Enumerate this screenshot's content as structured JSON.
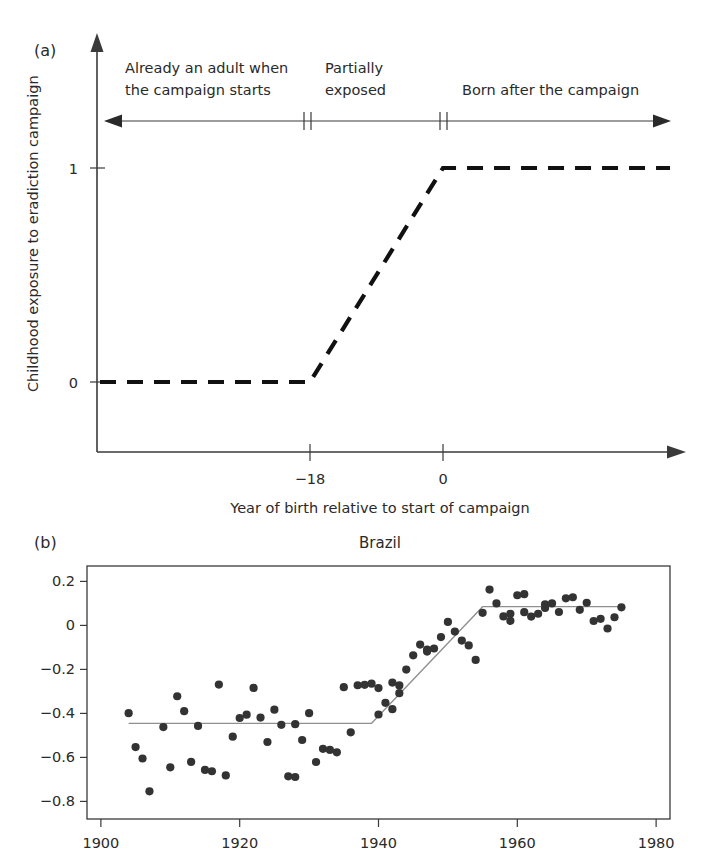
{
  "figure": {
    "panel_a": {
      "label": "(a)",
      "ylabel": "Childhood exposure to eradiction campaign",
      "xlabel": "Year of birth relative to start of campaign",
      "yticks": [
        "1",
        "0"
      ],
      "xticks": [
        "−18",
        "0"
      ],
      "annotations": [
        {
          "line1": "Already an adult when",
          "line2": "the campaign starts"
        },
        {
          "line1": "Partially",
          "line2": "exposed"
        },
        {
          "line1": "Born after the campaign",
          "line2": ""
        }
      ],
      "colors": {
        "line": "#111111",
        "axis": "#3a3a3a"
      }
    },
    "panel_b": {
      "label": "(b)",
      "title": "Brazil"
    }
  },
  "chart_data": [
    {
      "type": "line",
      "title": "",
      "xlabel": "Year of birth relative to start of campaign",
      "ylabel": "Childhood exposure to eradiction campaign",
      "xlim": [
        -40,
        25
      ],
      "ylim": [
        -0.35,
        1.55
      ],
      "xticks": [
        -18,
        0
      ],
      "xticklabels": [
        "−18",
        "0"
      ],
      "yticks": [
        0,
        1
      ],
      "yticklabels": [
        "0",
        "1"
      ],
      "grid": false,
      "legend": "none",
      "series": [
        {
          "name": "exposure step",
          "style": "dashed",
          "x": [
            -40,
            -18,
            0,
            25
          ],
          "values": [
            0,
            0,
            1,
            1
          ]
        }
      ],
      "annotations": [
        {
          "text": "Already an adult when the campaign starts",
          "x_range": [
            -40,
            -18
          ]
        },
        {
          "text": "Partially exposed",
          "x_range": [
            -18,
            0
          ]
        },
        {
          "text": "Born after the campaign",
          "x_range": [
            0,
            25
          ]
        }
      ]
    },
    {
      "type": "scatter",
      "title": "Brazil",
      "xlabel": "",
      "ylabel": "",
      "xlim": [
        1898,
        1982
      ],
      "ylim": [
        -0.88,
        0.27
      ],
      "xticks": [
        1900,
        1920,
        1940,
        1960,
        1980
      ],
      "yticks": [
        0.2,
        0,
        -0.2,
        -0.4,
        -0.6,
        -0.8
      ],
      "yticklabels": [
        "0.2",
        "0",
        "−0.2",
        "−0.4",
        "−0.6",
        "−0.8"
      ],
      "grid": false,
      "legend": "none",
      "points": [
        [
          1904,
          -0.399
        ],
        [
          1905,
          -0.553
        ],
        [
          1906,
          -0.605
        ],
        [
          1907,
          -0.754
        ],
        [
          1909,
          -0.462
        ],
        [
          1910,
          -0.645
        ],
        [
          1911,
          -0.322
        ],
        [
          1912,
          -0.39
        ],
        [
          1913,
          -0.62
        ],
        [
          1914,
          -0.457
        ],
        [
          1915,
          -0.657
        ],
        [
          1916,
          -0.663
        ],
        [
          1917,
          -0.269
        ],
        [
          1918,
          -0.682
        ],
        [
          1919,
          -0.506
        ],
        [
          1920,
          -0.421
        ],
        [
          1921,
          -0.406
        ],
        [
          1922,
          -0.284
        ],
        [
          1923,
          -0.419
        ],
        [
          1924,
          -0.53
        ],
        [
          1925,
          -0.383
        ],
        [
          1926,
          -0.452
        ],
        [
          1927,
          -0.686
        ],
        [
          1928,
          -0.689
        ],
        [
          1928,
          -0.449
        ],
        [
          1929,
          -0.521
        ],
        [
          1930,
          -0.399
        ],
        [
          1931,
          -0.621
        ],
        [
          1932,
          -0.561
        ],
        [
          1933,
          -0.566
        ],
        [
          1934,
          -0.577
        ],
        [
          1935,
          -0.281
        ],
        [
          1936,
          -0.486
        ],
        [
          1937,
          -0.272
        ],
        [
          1938,
          -0.27
        ],
        [
          1939,
          -0.265
        ],
        [
          1940,
          -0.405
        ],
        [
          1940,
          -0.285
        ],
        [
          1941,
          -0.352
        ],
        [
          1942,
          -0.26
        ],
        [
          1942,
          -0.381
        ],
        [
          1943,
          -0.273
        ],
        [
          1943,
          -0.308
        ],
        [
          1944,
          -0.201
        ],
        [
          1945,
          -0.136
        ],
        [
          1946,
          -0.087
        ],
        [
          1947,
          -0.11
        ],
        [
          1947,
          -0.119
        ],
        [
          1948,
          -0.105
        ],
        [
          1949,
          -0.053
        ],
        [
          1950,
          0.016
        ],
        [
          1951,
          -0.028
        ],
        [
          1952,
          -0.069
        ],
        [
          1953,
          -0.091
        ],
        [
          1954,
          -0.157
        ],
        [
          1955,
          0.057
        ],
        [
          1956,
          0.163
        ],
        [
          1957,
          0.1
        ],
        [
          1958,
          0.041
        ],
        [
          1959,
          0.053
        ],
        [
          1959,
          0.021
        ],
        [
          1960,
          0.137
        ],
        [
          1961,
          0.06
        ],
        [
          1961,
          0.142
        ],
        [
          1962,
          0.04
        ],
        [
          1963,
          0.053
        ],
        [
          1964,
          0.096
        ],
        [
          1964,
          0.079
        ],
        [
          1965,
          0.1
        ],
        [
          1966,
          0.061
        ],
        [
          1967,
          0.123
        ],
        [
          1968,
          0.128
        ],
        [
          1969,
          0.071
        ],
        [
          1970,
          0.103
        ],
        [
          1971,
          0.02
        ],
        [
          1972,
          0.03
        ],
        [
          1973,
          -0.014
        ],
        [
          1974,
          0.037
        ],
        [
          1975,
          0.082
        ]
      ],
      "fit_line": {
        "name": "piecewise fit",
        "x": [
          1904,
          1939,
          1955,
          1975
        ],
        "values": [
          -0.445,
          -0.445,
          0.085,
          0.085
        ],
        "color": "#8f8f8f"
      }
    }
  ]
}
